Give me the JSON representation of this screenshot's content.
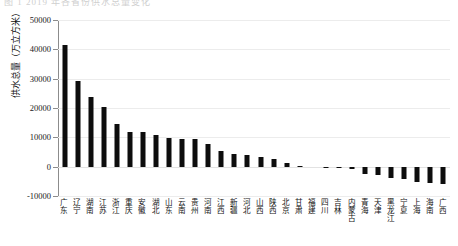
{
  "top_strip": {
    "ghost_text": "图 1  2019 年各省份供水总量变化"
  },
  "chart_data": {
    "type": "bar",
    "title": "",
    "xlabel": "",
    "ylabel": "供水总量（万立方米）",
    "ylim": [
      -10000,
      50000
    ],
    "yticks": [
      -10000,
      0,
      10000,
      20000,
      30000,
      40000,
      50000
    ],
    "ytick_labels": [
      "-10000",
      "0",
      "10000",
      "20000",
      "30000",
      "40000",
      "50000"
    ],
    "grid": true,
    "legend": null,
    "bar_color": "#0d0d0d",
    "categories": [
      "广东",
      "辽宁",
      "湖南",
      "江苏",
      "浙江",
      "重庆",
      "安徽",
      "湖北",
      "山东",
      "云南",
      "贵州",
      "河南",
      "江西",
      "新疆",
      "河北",
      "山西",
      "陕西",
      "北京",
      "甘肃",
      "福建",
      "四川",
      "吉林",
      "内蒙古",
      "青海",
      "天津",
      "黑龙江",
      "宁夏",
      "上海",
      "海南",
      "广西"
    ],
    "values": [
      41500,
      29200,
      23900,
      20200,
      14500,
      11900,
      11800,
      10700,
      9700,
      9600,
      9500,
      7600,
      5200,
      4200,
      3900,
      3400,
      2600,
      1100,
      300,
      0,
      -200,
      -400,
      -900,
      -2400,
      -3000,
      -4000,
      -4300,
      -5300,
      -5700,
      -5900
    ]
  }
}
